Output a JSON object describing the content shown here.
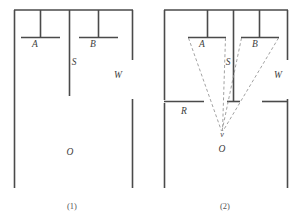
{
  "figure": {
    "background_color": "#ffffff",
    "line_color": "#4a4a4a",
    "dashed_ray_color": "#8a8a8a",
    "panels": [
      {
        "id": "panel-1",
        "caption": "(1)",
        "caption_x": 72,
        "caption_y": 209,
        "labels": [
          {
            "name": "slit-a-label",
            "text": "A",
            "x": 35,
            "y": 47
          },
          {
            "name": "slit-b-label",
            "text": "B",
            "x": 93,
            "y": 47
          },
          {
            "name": "screen-s-label",
            "text": "S",
            "x": 73,
            "y": 64
          },
          {
            "name": "wall-w-label",
            "text": "W",
            "x": 118,
            "y": 77
          },
          {
            "name": "observer-o-label",
            "text": "O",
            "x": 70,
            "y": 154
          }
        ]
      },
      {
        "id": "panel-2",
        "caption": "(2)",
        "caption_x": 225,
        "caption_y": 209,
        "labels": [
          {
            "name": "slit-a-label",
            "text": "A",
            "x": 202,
            "y": 47
          },
          {
            "name": "slit-b-label",
            "text": "B",
            "x": 255,
            "y": 47
          },
          {
            "name": "screen-s-label",
            "text": "S",
            "x": 228,
            "y": 64
          },
          {
            "name": "wall-w-label",
            "text": "W",
            "x": 278,
            "y": 77
          },
          {
            "name": "region-r-label",
            "text": "R",
            "x": 184,
            "y": 114
          },
          {
            "name": "observer-o-label",
            "text": "O",
            "x": 222,
            "y": 152
          },
          {
            "name": "vertex-v-mark",
            "text": "v",
            "x": 222,
            "y": 137
          }
        ]
      }
    ],
    "geometry_note": "Panel 1: open chamber with slits A and B, central divider S, outer walls W, observation point O at bottom. Panel 2: same chamber with additional horizontal wall R and dashed rays from slit edges converging to point O."
  }
}
